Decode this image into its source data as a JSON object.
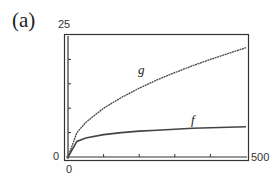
{
  "part_label": "(a)",
  "chart_data": {
    "type": "line",
    "title": "",
    "xlabel": "",
    "ylabel": "",
    "xlim": [
      0,
      500
    ],
    "ylim": [
      0,
      25
    ],
    "x_tick_labels": {
      "min": "0",
      "max": "500"
    },
    "y_tick_labels": {
      "min": "0",
      "max": "25"
    },
    "grid": false,
    "legend": "inline labels",
    "x": [
      0,
      25,
      50,
      100,
      150,
      200,
      250,
      300,
      350,
      400,
      450,
      500
    ],
    "series": [
      {
        "name": "g",
        "values": [
          0,
          5.0,
          7.1,
          10.0,
          12.2,
          14.1,
          15.8,
          17.3,
          18.7,
          20.0,
          21.2,
          22.4
        ]
      },
      {
        "name": "f",
        "values": [
          0,
          3.2,
          3.9,
          4.6,
          5.0,
          5.3,
          5.5,
          5.7,
          5.9,
          6.0,
          6.1,
          6.2
        ]
      }
    ]
  },
  "labels": {
    "g": "g",
    "f": "f",
    "y_max": "25",
    "y_min": "0",
    "x_min": "0",
    "x_max": "500"
  }
}
